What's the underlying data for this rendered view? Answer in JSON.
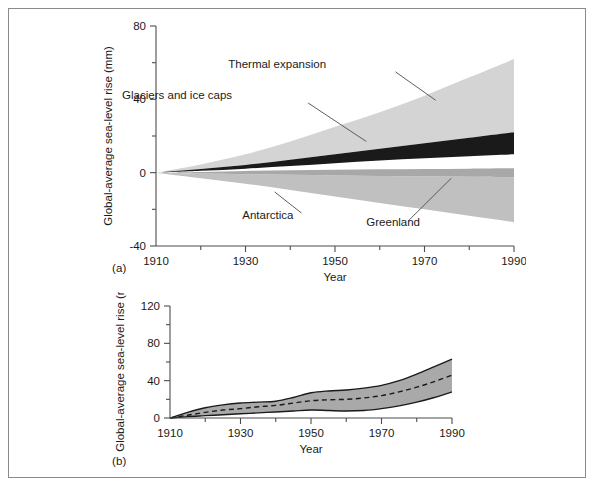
{
  "figure": {
    "panel_a_caption": "(a)",
    "panel_b_caption": "(b)"
  },
  "chart_data": [
    {
      "id": "panel-a",
      "type": "area",
      "title": "",
      "subtitle": "",
      "xlabel": "Year",
      "ylabel": "Global-average sea-level rise (mm)",
      "xlim": [
        1910,
        1990
      ],
      "ylim": [
        -40,
        80
      ],
      "xticks": [
        1910,
        1930,
        1950,
        1970,
        1990
      ],
      "xticklabels": [
        "1910",
        "1930",
        "1950",
        "1970",
        "1990"
      ],
      "xminorticks": [
        1920,
        1940,
        1960,
        1980
      ],
      "yticks": [
        -40,
        0,
        40,
        80
      ],
      "yticklabels": [
        "-40",
        "0",
        "40",
        "80"
      ],
      "yminorticks": [
        -20,
        20,
        60
      ],
      "grid": false,
      "legend": "none",
      "stacking": "cumulative-bands",
      "x": [
        1910,
        1920,
        1930,
        1940,
        1950,
        1960,
        1970,
        1980,
        1990
      ],
      "bands": [
        {
          "name": "Thermal expansion",
          "color": "#d4d4d4",
          "label_position": "upper-right",
          "lower": [
            0,
            2.0,
            4.2,
            7.0,
            10.0,
            13.0,
            16.0,
            19.0,
            22.0
          ],
          "upper": [
            0,
            4.5,
            10.0,
            17.0,
            25.0,
            33.0,
            42.0,
            52.0,
            62.0
          ]
        },
        {
          "name": "Glaciers and ice caps",
          "color": "#1a1a1a",
          "label_position": "upper-left",
          "lower": [
            0,
            1.0,
            2.2,
            3.6,
            5.2,
            6.6,
            7.8,
            9.0,
            10.0
          ],
          "upper": [
            0,
            2.0,
            4.2,
            7.0,
            10.0,
            13.0,
            16.0,
            19.0,
            22.0
          ]
        },
        {
          "name": "Greenland",
          "color": "#a8a8a8",
          "label_position": "lower-right",
          "lower": [
            0,
            -0.4,
            -0.8,
            -1.2,
            -1.5,
            -1.8,
            -2.0,
            -2.2,
            -2.5
          ],
          "upper": [
            0,
            0.4,
            0.9,
            1.3,
            1.6,
            1.8,
            2.0,
            2.2,
            2.4
          ]
        },
        {
          "name": "Antarctica",
          "color": "#c0c0c0",
          "label_position": "lower-left",
          "lower": [
            0,
            -3.0,
            -6.0,
            -9.5,
            -13.0,
            -16.5,
            -20.0,
            -23.5,
            -27.0
          ],
          "upper": [
            0,
            -0.4,
            -0.8,
            -1.2,
            -1.5,
            -1.8,
            -2.0,
            -2.2,
            -2.5
          ]
        }
      ],
      "annotations": [
        {
          "text": "Thermal expansion",
          "x": 1948,
          "y": 57
        },
        {
          "text": "Glaciers and ice caps",
          "x": 1927,
          "y": 40
        },
        {
          "text": "Antarctica",
          "x": 1935,
          "y": -25
        },
        {
          "text": "Greenland",
          "x": 1963,
          "y": -29
        }
      ]
    },
    {
      "id": "panel-b",
      "type": "area",
      "title": "",
      "subtitle": "",
      "xlabel": "Year",
      "ylabel": "Global-average sea-level rise (mm)",
      "xlim": [
        1910,
        1990
      ],
      "ylim": [
        0,
        120
      ],
      "xticks": [
        1910,
        1930,
        1950,
        1970,
        1990
      ],
      "xticklabels": [
        "1910",
        "1930",
        "1950",
        "1970",
        "1990"
      ],
      "xminorticks": [
        1920,
        1940,
        1960,
        1980
      ],
      "yticks": [
        0,
        40,
        80,
        120
      ],
      "yticklabels": [
        "0",
        "40",
        "80",
        "120"
      ],
      "yminorticks": [
        20,
        60,
        100
      ],
      "grid": false,
      "legend": "none",
      "x": [
        1910,
        1915,
        1920,
        1925,
        1930,
        1935,
        1940,
        1945,
        1950,
        1955,
        1960,
        1965,
        1970,
        1975,
        1980,
        1985,
        1990
      ],
      "series": [
        {
          "name": "upper bound",
          "style": "solid",
          "color": "#1a1a1a",
          "values": [
            0,
            6,
            11,
            14,
            16,
            17,
            18,
            22,
            27,
            29,
            30,
            32,
            35,
            40,
            47,
            55,
            63
          ]
        },
        {
          "name": "best estimate",
          "style": "dashed",
          "color": "#1a1a1a",
          "values": [
            0,
            3,
            6,
            8.5,
            10,
            12,
            13.5,
            16,
            18.5,
            19.5,
            20,
            21.5,
            24,
            28,
            33,
            39,
            46
          ]
        },
        {
          "name": "lower bound",
          "style": "solid",
          "color": "#1a1a1a",
          "values": [
            0,
            1.5,
            2.5,
            3.5,
            4.5,
            5.5,
            6.5,
            7.5,
            8.5,
            8.0,
            7.5,
            8.0,
            10,
            13,
            17,
            22,
            28
          ]
        }
      ],
      "band_fill_color": "#a9a9a9"
    }
  ]
}
